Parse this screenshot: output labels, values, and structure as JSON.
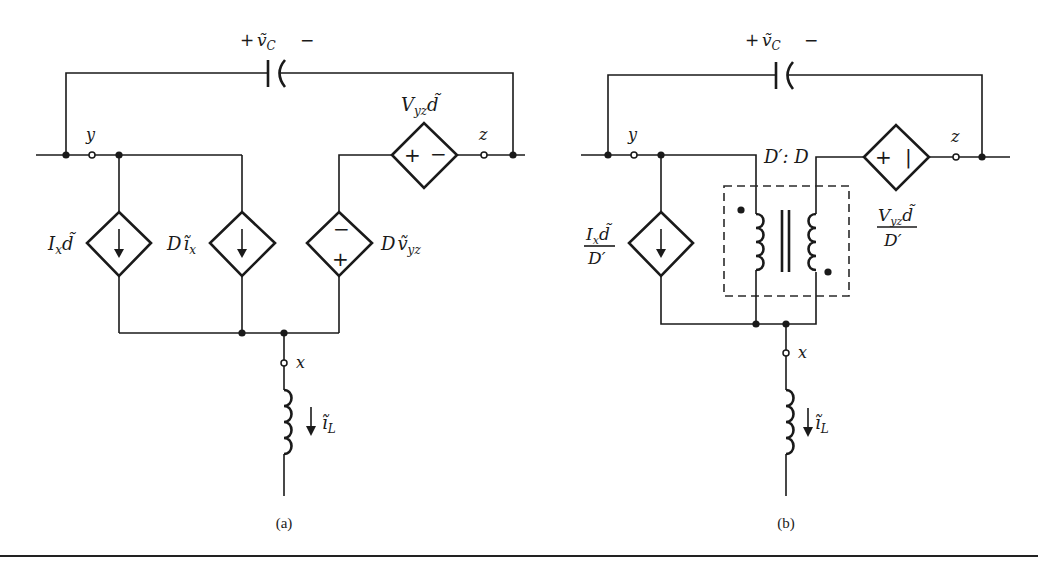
{
  "figure": {
    "a": {
      "caption": "(a)",
      "capacitor_label": {
        "plus": "+",
        "name": "ṽ",
        "sub": "C",
        "minus": "−"
      },
      "terminals": {
        "y": "y",
        "z": "z",
        "x": "x"
      },
      "series_source": {
        "label_main": "V",
        "label_sub": "yz",
        "label_tail": "d̃",
        "polarity_left": "+",
        "polarity_right": "−"
      },
      "sources": [
        {
          "label_main": "I",
          "label_sub": "x",
          "label_tail": "d̃",
          "type": "current"
        },
        {
          "label_main": "D",
          "label_tail": "ĩ",
          "label_sub": "x",
          "type": "current"
        },
        {
          "label_main": "D",
          "label_tail": "ṽ",
          "label_sub": "yz",
          "type": "voltage",
          "polarity_top": "−",
          "polarity_bottom": "+"
        }
      ],
      "inductor_label": {
        "name": "ĩ",
        "sub": "L"
      }
    },
    "b": {
      "caption": "(b)",
      "capacitor_label": {
        "plus": "+",
        "name": "ṽ",
        "sub": "C",
        "minus": "−"
      },
      "terminals": {
        "y": "y",
        "z": "z",
        "x": "x"
      },
      "transformer_ratio": "D′: D",
      "series_source": {
        "num_main": "V",
        "num_sub": "yz",
        "num_tail": "d̃",
        "den": "D′",
        "polarity_left": "+",
        "polarity_right": "|"
      },
      "current_source": {
        "num_main": "I",
        "num_sub": "x",
        "num_tail": "d̃",
        "den": "D′"
      },
      "inductor_label": {
        "name": "ĩ",
        "sub": "L"
      }
    }
  },
  "colors": {
    "ink": "#1a1a1a",
    "background": "#ffffff"
  }
}
